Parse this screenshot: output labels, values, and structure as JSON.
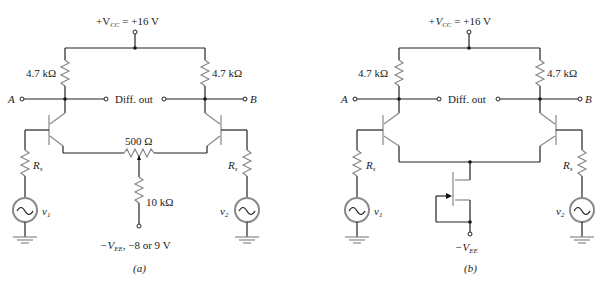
{
  "figure_a": {
    "supply_label": "+V",
    "supply_sub": "CC",
    "supply_value": " = +16 V",
    "rc_left": "4.7 kΩ",
    "rc_right": "4.7 kΩ",
    "terminal_a": "A",
    "terminal_b": "B",
    "diff_out": "Diff. out",
    "pot_label": "500 Ω",
    "re_label": "10 kΩ",
    "rs_left": "R",
    "rs_left_sub": "s",
    "rs_right": "R",
    "rs_right_sub": "s",
    "v1": "v",
    "v1_sub": "1",
    "v2": "v",
    "v2_sub": "2",
    "vee_label": "−V",
    "vee_sub": "EE",
    "vee_value": ", −8 or 9 V",
    "caption": "(a)"
  },
  "figure_b": {
    "supply_label": "+V",
    "supply_sub": "CC",
    "supply_value": " = +16 V",
    "rc_left": "4.7 kΩ",
    "rc_right": "4.7 kΩ",
    "terminal_a": "A",
    "terminal_b": "B",
    "diff_out": "Diff. out",
    "rs_left": "R",
    "rs_left_sub": "s",
    "rs_right": "R",
    "rs_right_sub": "s",
    "v1": "v",
    "v1_sub": "1",
    "v2": "v",
    "v2_sub": "2",
    "vee_label": "−V",
    "vee_sub": "EE",
    "caption": "(b)"
  }
}
